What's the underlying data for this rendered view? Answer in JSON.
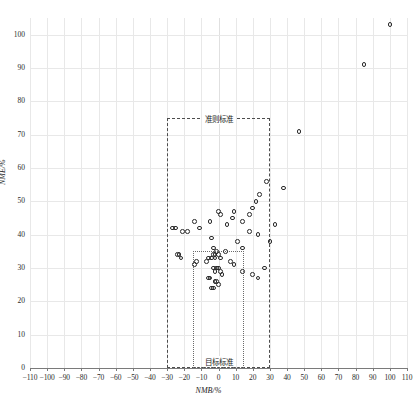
{
  "chart_data": {
    "type": "scatter",
    "title": "",
    "xlabel": "NMB/%",
    "ylabel": "NME/%",
    "xlim": [
      -110,
      110
    ],
    "ylim": [
      0,
      105
    ],
    "xticks": [
      -110,
      -100,
      -90,
      -80,
      -70,
      -60,
      -50,
      -40,
      -30,
      -20,
      -10,
      0,
      10,
      20,
      30,
      40,
      50,
      60,
      70,
      80,
      90,
      100,
      110
    ],
    "yticks": [
      0,
      10,
      20,
      30,
      40,
      50,
      60,
      70,
      80,
      90,
      100
    ],
    "grid": true,
    "legend_position": "none",
    "series": [
      {
        "name": "sites",
        "marker": "open-circle",
        "color": "#2a2a2a",
        "points": [
          [
            100,
            103
          ],
          [
            85,
            91
          ],
          [
            47,
            71
          ],
          [
            38,
            54
          ],
          [
            28,
            56
          ],
          [
            24,
            52
          ],
          [
            22,
            50
          ],
          [
            20,
            48
          ],
          [
            18,
            46
          ],
          [
            14,
            44
          ],
          [
            9,
            47
          ],
          [
            8,
            45
          ],
          [
            5,
            43
          ],
          [
            1,
            46
          ],
          [
            0,
            47
          ],
          [
            -5,
            44
          ],
          [
            -11,
            42
          ],
          [
            -14,
            44
          ],
          [
            -18,
            41
          ],
          [
            -21,
            41
          ],
          [
            -25,
            42
          ],
          [
            -27,
            42
          ],
          [
            -4,
            39
          ],
          [
            11,
            38
          ],
          [
            18,
            41
          ],
          [
            23,
            40
          ],
          [
            30,
            38
          ],
          [
            33,
            43
          ],
          [
            -3,
            36
          ],
          [
            -24,
            34
          ],
          [
            -23,
            34
          ],
          [
            -22,
            33
          ],
          [
            14,
            36
          ],
          [
            4,
            35
          ],
          [
            -1,
            35
          ],
          [
            -2,
            34
          ],
          [
            -3,
            34
          ],
          [
            -4,
            33
          ],
          [
            -2,
            33
          ],
          [
            0,
            34
          ],
          [
            1,
            33
          ],
          [
            -6,
            33
          ],
          [
            -7,
            32
          ],
          [
            -13,
            32
          ],
          [
            -14,
            31
          ],
          [
            7,
            32
          ],
          [
            9,
            31
          ],
          [
            -1,
            30
          ],
          [
            0,
            30
          ],
          [
            1,
            29
          ],
          [
            -2,
            29
          ],
          [
            -3,
            30
          ],
          [
            2,
            28
          ],
          [
            -5,
            27
          ],
          [
            -6,
            27
          ],
          [
            -2,
            26
          ],
          [
            -1,
            26
          ],
          [
            0,
            25
          ],
          [
            -4,
            24
          ],
          [
            -3,
            24
          ],
          [
            20,
            28
          ],
          [
            27,
            30
          ],
          [
            23,
            27
          ],
          [
            14,
            29
          ]
        ]
      }
    ],
    "reference_boxes": [
      {
        "name": "criterion-standard",
        "label": "准则标准",
        "x_range": [
          -30,
          30
        ],
        "y_range": [
          0,
          75
        ],
        "style": "dashed"
      },
      {
        "name": "goal-standard",
        "label": "目标标准",
        "x_range": [
          -15,
          15
        ],
        "y_range": [
          0,
          35
        ],
        "style": "dotted"
      }
    ]
  },
  "axes": {
    "x_title": "NMB/%",
    "y_title": "NME/%",
    "x_tick_labels": [
      "−110",
      "−100",
      "−90",
      "−80",
      "−70",
      "−60",
      "−50",
      "−40",
      "−30",
      "−20",
      "−10",
      "0",
      "10",
      "20",
      "30",
      "40",
      "50",
      "60",
      "70",
      "80",
      "90",
      "100",
      "110"
    ],
    "y_tick_labels": [
      "0",
      "10",
      "20",
      "30",
      "40",
      "50",
      "60",
      "70",
      "80",
      "90",
      "100"
    ]
  },
  "annotations": {
    "criterion_label": "准则标准",
    "goal_label": "目标标准"
  },
  "colors": {
    "marker_stroke": "#2a2a2a",
    "gridline": "#e8e8e8",
    "criterion_box": "#4d4d4d",
    "goal_box": "#6b6b6b",
    "axis": "#7a7a7a"
  }
}
